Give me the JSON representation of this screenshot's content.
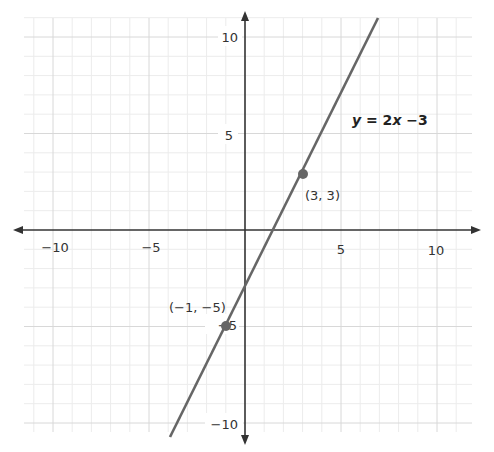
{
  "chart_data": {
    "type": "line",
    "title": "",
    "xlabel": "",
    "ylabel": "",
    "xlim": [
      -11.5,
      11.8
    ],
    "ylim": [
      -10.5,
      11
    ],
    "grid": true,
    "grid_minor_step": 1,
    "grid_major_step": 5,
    "x_ticks": [
      -10,
      -5,
      5,
      10
    ],
    "y_ticks": [
      10,
      5,
      -5,
      -10
    ],
    "x_tick_labels": [
      "−10",
      "−5",
      "5",
      "10"
    ],
    "y_tick_labels": [
      "10",
      "5",
      "−5",
      "−10"
    ],
    "series": [
      {
        "name": "y = 2x −3",
        "slope": 2,
        "intercept": -3,
        "x": [
          -3.9,
          6.9
        ],
        "y": [
          -10.8,
          10.8
        ],
        "color": "#666666"
      }
    ],
    "points": [
      {
        "x": 3,
        "y": 3,
        "label": "(3, 3)"
      },
      {
        "x": -1,
        "y": -5,
        "label": "(−1, −5)"
      }
    ],
    "annotations": [
      {
        "text": "y = 2x −3",
        "x": 8,
        "y": 4.9
      }
    ],
    "colors": {
      "axis": "#333333",
      "line": "#666666",
      "point": "#666666",
      "grid_minor": "#ececec",
      "grid_major": "#d8d8d8"
    }
  },
  "labels": {
    "equation_y": "y",
    "equation_eq": " = 2",
    "equation_x": "x",
    "equation_rest": " −3",
    "point_a": "(3, 3)",
    "point_b": "(−1, −5)",
    "x_neg10": "−10",
    "x_neg5": "−5",
    "x_5": "5",
    "x_10": "10",
    "y_10": "10",
    "y_5": "5",
    "y_neg5": "−5",
    "y_neg10": "−10"
  }
}
